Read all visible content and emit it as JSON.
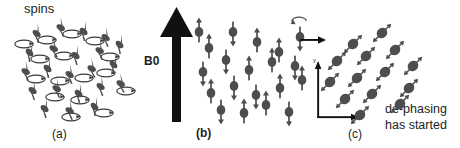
{
  "figure": {
    "background": "#ffffff",
    "spin_color": "#4d4d4d",
    "ink_color": "#231f20"
  },
  "panel_a": {
    "caption": "(a)",
    "label": "spins",
    "description": "randomly oriented precessing spins with precession cones",
    "spin_count": 22,
    "spins": [
      {
        "x": 37,
        "y": 33,
        "angle": 35
      },
      {
        "x": 61,
        "y": 27,
        "angle": 28
      },
      {
        "x": 84,
        "y": 31,
        "angle": 40
      },
      {
        "x": 106,
        "y": 37,
        "angle": 32
      },
      {
        "x": 30,
        "y": 52,
        "angle": 45
      },
      {
        "x": 54,
        "y": 48,
        "angle": 25
      },
      {
        "x": 76,
        "y": 55,
        "angle": 38
      },
      {
        "x": 100,
        "y": 50,
        "angle": 30
      },
      {
        "x": 120,
        "y": 44,
        "angle": 42
      },
      {
        "x": 26,
        "y": 71,
        "angle": 30
      },
      {
        "x": 48,
        "y": 68,
        "angle": 40
      },
      {
        "x": 70,
        "y": 74,
        "angle": 33
      },
      {
        "x": 92,
        "y": 68,
        "angle": 27
      },
      {
        "x": 114,
        "y": 64,
        "angle": 44
      },
      {
        "x": 33,
        "y": 90,
        "angle": 36
      },
      {
        "x": 57,
        "y": 88,
        "angle": 29
      },
      {
        "x": 79,
        "y": 93,
        "angle": 41
      },
      {
        "x": 101,
        "y": 86,
        "angle": 34
      },
      {
        "x": 121,
        "y": 83,
        "angle": 26
      },
      {
        "x": 45,
        "y": 108,
        "angle": 38
      },
      {
        "x": 70,
        "y": 110,
        "angle": 31
      },
      {
        "x": 95,
        "y": 106,
        "angle": 43
      }
    ],
    "cones": [
      {
        "x": 47,
        "y": 40
      },
      {
        "x": 72,
        "y": 34
      },
      {
        "x": 95,
        "y": 41
      },
      {
        "x": 40,
        "y": 59
      },
      {
        "x": 64,
        "y": 56
      },
      {
        "x": 110,
        "y": 57
      },
      {
        "x": 36,
        "y": 79
      },
      {
        "x": 60,
        "y": 81
      },
      {
        "x": 84,
        "y": 78
      },
      {
        "x": 106,
        "y": 73
      },
      {
        "x": 126,
        "y": 91
      },
      {
        "x": 55,
        "y": 97
      },
      {
        "x": 80,
        "y": 100
      },
      {
        "x": 71,
        "y": 117
      },
      {
        "x": 104,
        "y": 113
      },
      {
        "x": 24,
        "y": 44
      }
    ]
  },
  "panel_b": {
    "caption": "(b)",
    "field_label": "B0",
    "description": "spins aligned parallel and antiparallel to the B0 field",
    "field_arrow": {
      "direction": "up",
      "x": 177,
      "y_top": 8,
      "y_bottom": 122
    },
    "spin_count": 20,
    "spins": [
      {
        "x": 209,
        "y": 48,
        "dir": "up"
      },
      {
        "x": 233,
        "y": 32,
        "dir": "down"
      },
      {
        "x": 257,
        "y": 42,
        "dir": "up"
      },
      {
        "x": 279,
        "y": 52,
        "dir": "up"
      },
      {
        "x": 300,
        "y": 37,
        "dir": "down"
      },
      {
        "x": 203,
        "y": 72,
        "dir": "down"
      },
      {
        "x": 226,
        "y": 60,
        "dir": "down"
      },
      {
        "x": 249,
        "y": 70,
        "dir": "up"
      },
      {
        "x": 272,
        "y": 62,
        "dir": "up"
      },
      {
        "x": 295,
        "y": 66,
        "dir": "down"
      },
      {
        "x": 211,
        "y": 93,
        "dir": "up"
      },
      {
        "x": 234,
        "y": 86,
        "dir": "down"
      },
      {
        "x": 256,
        "y": 95,
        "dir": "down"
      },
      {
        "x": 280,
        "y": 88,
        "dir": "up"
      },
      {
        "x": 302,
        "y": 80,
        "dir": "up"
      },
      {
        "x": 221,
        "y": 110,
        "dir": "down"
      },
      {
        "x": 244,
        "y": 113,
        "dir": "up"
      },
      {
        "x": 266,
        "y": 105,
        "dir": "up"
      },
      {
        "x": 289,
        "y": 112,
        "dir": "down"
      },
      {
        "x": 199,
        "y": 32,
        "dir": "up"
      }
    ],
    "precession_marker": {
      "x": 300,
      "y": 22,
      "type": "curved-arrow"
    }
  },
  "panel_c": {
    "caption": "(c)",
    "note_line1": "de-phasing",
    "note_line2": "has started",
    "description": "spins tilted into the transverse plane, beginning to de-phase",
    "transition_arrow": {
      "x_start": 300,
      "y": 40,
      "x_end": 326,
      "direction": "right"
    },
    "axes": {
      "origin": {
        "x": 318,
        "y": 118
      },
      "y_label": "y",
      "x_label": "x",
      "y_tip": {
        "x": 318,
        "y": 62
      },
      "x_tip": {
        "x": 358,
        "y": 118
      }
    },
    "spin_count": 14,
    "spins": [
      {
        "x": 353,
        "y": 44,
        "angle": 45
      },
      {
        "x": 382,
        "y": 33,
        "angle": 45
      },
      {
        "x": 337,
        "y": 61,
        "angle": 45
      },
      {
        "x": 366,
        "y": 56,
        "angle": 45
      },
      {
        "x": 395,
        "y": 50,
        "angle": 45
      },
      {
        "x": 413,
        "y": 66,
        "angle": 45
      },
      {
        "x": 330,
        "y": 82,
        "angle": 45
      },
      {
        "x": 357,
        "y": 78,
        "angle": 45
      },
      {
        "x": 385,
        "y": 72,
        "angle": 45
      },
      {
        "x": 409,
        "y": 88,
        "angle": 45
      },
      {
        "x": 345,
        "y": 99,
        "angle": 45
      },
      {
        "x": 372,
        "y": 94,
        "angle": 45
      },
      {
        "x": 400,
        "y": 104,
        "angle": 45
      },
      {
        "x": 360,
        "y": 115,
        "angle": 45
      }
    ]
  }
}
